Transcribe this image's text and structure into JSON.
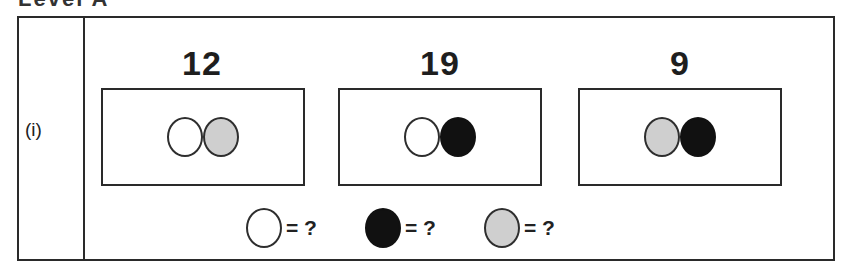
{
  "heading": "Level A",
  "problem": {
    "label": "(i)",
    "groups": [
      {
        "total": "12",
        "circles": [
          "white",
          "grey"
        ]
      },
      {
        "total": "19",
        "circles": [
          "white",
          "black"
        ]
      },
      {
        "total": "9",
        "circles": [
          "grey",
          "black"
        ]
      }
    ],
    "legend": [
      {
        "color": "white",
        "text": "= ?"
      },
      {
        "color": "black",
        "text": "= ?"
      },
      {
        "color": "grey",
        "text": "= ?"
      }
    ]
  },
  "colors": {
    "white": "#ffffff",
    "grey": "#cfcfcf",
    "black": "#111111",
    "border": "#2a2a2a"
  }
}
